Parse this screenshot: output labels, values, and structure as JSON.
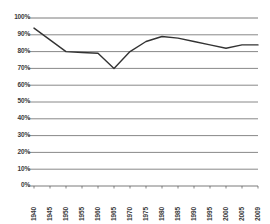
{
  "chart_data": {
    "type": "line",
    "title": "",
    "subtitle": "",
    "xlabel": "",
    "ylabel": "",
    "categories": [
      "1940",
      "1945",
      "1950",
      "1955",
      "1960",
      "1965",
      "1970",
      "1975",
      "1980",
      "1985",
      "1990",
      "1995",
      "2000",
      "2005",
      "2009"
    ],
    "values": [
      94,
      87,
      80,
      79.5,
      79,
      70,
      80,
      86,
      89,
      88,
      86,
      84,
      82,
      84,
      84
    ],
    "series": [
      {
        "name": "series-1",
        "values": [
          94,
          87,
          80,
          79.5,
          79,
          70,
          80,
          86,
          89,
          88,
          86,
          84,
          82,
          84,
          84
        ],
        "color": "#333333"
      }
    ],
    "ylim": [
      0,
      100
    ],
    "ytick_values": [
      0,
      10,
      20,
      30,
      40,
      50,
      60,
      70,
      80,
      90,
      100
    ],
    "ytick_labels": [
      "0%",
      "10%",
      "20%",
      "30%",
      "40%",
      "50%",
      "60%",
      "70%",
      "80%",
      "90%",
      "100%"
    ],
    "grid": true,
    "grid_axis": "y",
    "grid_color": "#7a7a7a",
    "legend": false,
    "legend_position": "none",
    "x_tick_rotation": 90,
    "axis_color": "#555555",
    "background_color": "#ffffff"
  }
}
